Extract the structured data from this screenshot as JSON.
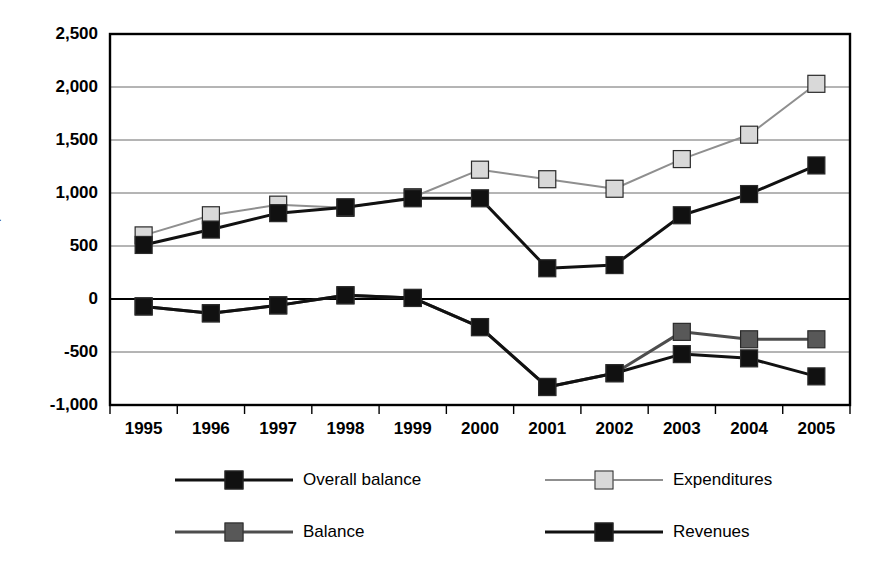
{
  "chart_data": {
    "type": "line",
    "title": "",
    "xlabel": "",
    "ylabel": "$ mns",
    "categories": [
      "1995",
      "1996",
      "1997",
      "1998",
      "1999",
      "2000",
      "2001",
      "2002",
      "2003",
      "2004",
      "2005"
    ],
    "ylim": [
      -1000,
      2500
    ],
    "yticks": [
      "2,500",
      "2,000",
      "1,500",
      "1,000",
      "500",
      "0",
      "-500",
      "-1,000"
    ],
    "ytick_values": [
      2500,
      2000,
      1500,
      1000,
      500,
      0,
      -500,
      -1000
    ],
    "grid": true,
    "legend_position": "bottom",
    "series": [
      {
        "name": "Overall balance",
        "values": [
          -70,
          -135,
          -60,
          35,
          10,
          -265,
          -830,
          -700,
          -520,
          -560,
          -730
        ],
        "line_color": "#111111",
        "marker_color": "#111111",
        "line_width": 3
      },
      {
        "name": "Expenditures",
        "values": [
          600,
          790,
          890,
          860,
          960,
          1220,
          1130,
          1040,
          1320,
          1550,
          2030
        ],
        "line_color": "#8f8f8f",
        "marker_color": "#d9d9d9",
        "line_width": 2
      },
      {
        "name": "Balance",
        "values": [
          -70,
          -135,
          -60,
          35,
          10,
          -265,
          -830,
          -700,
          -310,
          -380,
          -380
        ],
        "line_color": "#4d4d4d",
        "marker_color": "#585858",
        "line_width": 3
      },
      {
        "name": "Revenues",
        "values": [
          510,
          655,
          810,
          865,
          950,
          950,
          290,
          320,
          790,
          990,
          1260
        ],
        "line_color": "#111111",
        "marker_color": "#111111",
        "line_width": 3
      }
    ]
  },
  "legend": {
    "items": [
      {
        "label": "Overall balance"
      },
      {
        "label": "Expenditures"
      },
      {
        "label": "Balance"
      },
      {
        "label": "Revenues"
      }
    ]
  }
}
